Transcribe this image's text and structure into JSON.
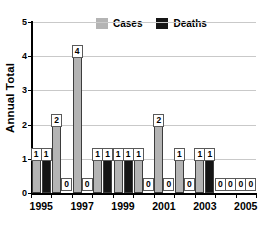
{
  "chart_data": {
    "type": "bar",
    "title": "",
    "xlabel": "",
    "ylabel": "Annual Total",
    "ylim": [
      0,
      5
    ],
    "yticks": [
      0,
      1,
      2,
      3,
      4,
      5
    ],
    "ytick_labels": [
      "0",
      "1",
      "2",
      "3",
      "4",
      "5"
    ],
    "grid": true,
    "legend_position": "top-center",
    "categories": [
      "1995",
      "1996",
      "1997",
      "1998",
      "1999",
      "2000",
      "2001",
      "2002",
      "2003",
      "2004",
      "2005"
    ],
    "xtick_labels": [
      "1995",
      "",
      "1997",
      "",
      "1999",
      "",
      "2001",
      "",
      "2003",
      "",
      "2005"
    ],
    "series": [
      {
        "name": "Cases",
        "color": "#b4b4b4",
        "values": [
          1,
          2,
          4,
          1,
          1,
          1,
          2,
          1,
          1,
          0,
          0
        ],
        "data_labels": [
          "1",
          "2",
          "4",
          "1",
          "1",
          "1",
          "2",
          "1",
          "1",
          "0",
          "0"
        ]
      },
      {
        "name": "Deaths",
        "color": "#151515",
        "values": [
          1,
          0,
          0,
          1,
          1,
          0,
          0,
          0,
          1,
          0,
          0
        ],
        "data_labels": [
          "1",
          "0",
          "0",
          "1",
          "1",
          "0",
          "0",
          "0",
          "1",
          "0",
          "0"
        ]
      }
    ]
  },
  "legend": {
    "items": [
      {
        "label": "Cases",
        "color": "#b4b4b4"
      },
      {
        "label": "Deaths",
        "color": "#151515"
      }
    ]
  },
  "axes": {
    "y_title": "Annual Total"
  }
}
